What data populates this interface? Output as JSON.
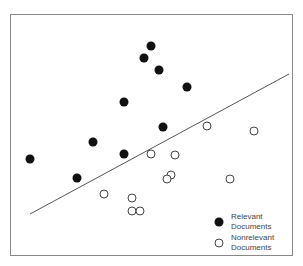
{
  "chart_data": {
    "type": "scatter",
    "title": "",
    "xlabel": "",
    "ylabel": "",
    "grid": false,
    "legend_position": "bottom-right inside",
    "series": [
      {
        "name": "Relevant Documents",
        "marker": "filled-circle",
        "points": [
          [
            151,
            46
          ],
          [
            144,
            58
          ],
          [
            159,
            70
          ],
          [
            187,
            87
          ],
          [
            124,
            102
          ],
          [
            163,
            127
          ],
          [
            93,
            142
          ],
          [
            124,
            154
          ],
          [
            30,
            159
          ],
          [
            77,
            178
          ]
        ]
      },
      {
        "name": "Nonrelevant Documents",
        "marker": "open-circle",
        "points": [
          [
            207,
            126
          ],
          [
            254,
            131
          ],
          [
            151,
            154
          ],
          [
            175,
            155
          ],
          [
            171,
            175
          ],
          [
            167,
            179
          ],
          [
            230,
            179
          ],
          [
            104,
            194
          ],
          [
            132,
            198
          ],
          [
            132,
            211
          ],
          [
            140,
            211
          ]
        ]
      }
    ],
    "annotations": [
      {
        "type": "separating-line",
        "from": [
          30,
          214
        ],
        "to": [
          289,
          74
        ]
      }
    ]
  },
  "legend": {
    "relevant_line1": "Relevant",
    "relevant_line2": "Documents",
    "nonrelevant_line1": "Nonrelevant",
    "nonrelevant_line2": "Documents"
  },
  "colors": {
    "filled": "#111111",
    "open_stroke": "#444444",
    "line": "#555555",
    "border": "#888888"
  }
}
